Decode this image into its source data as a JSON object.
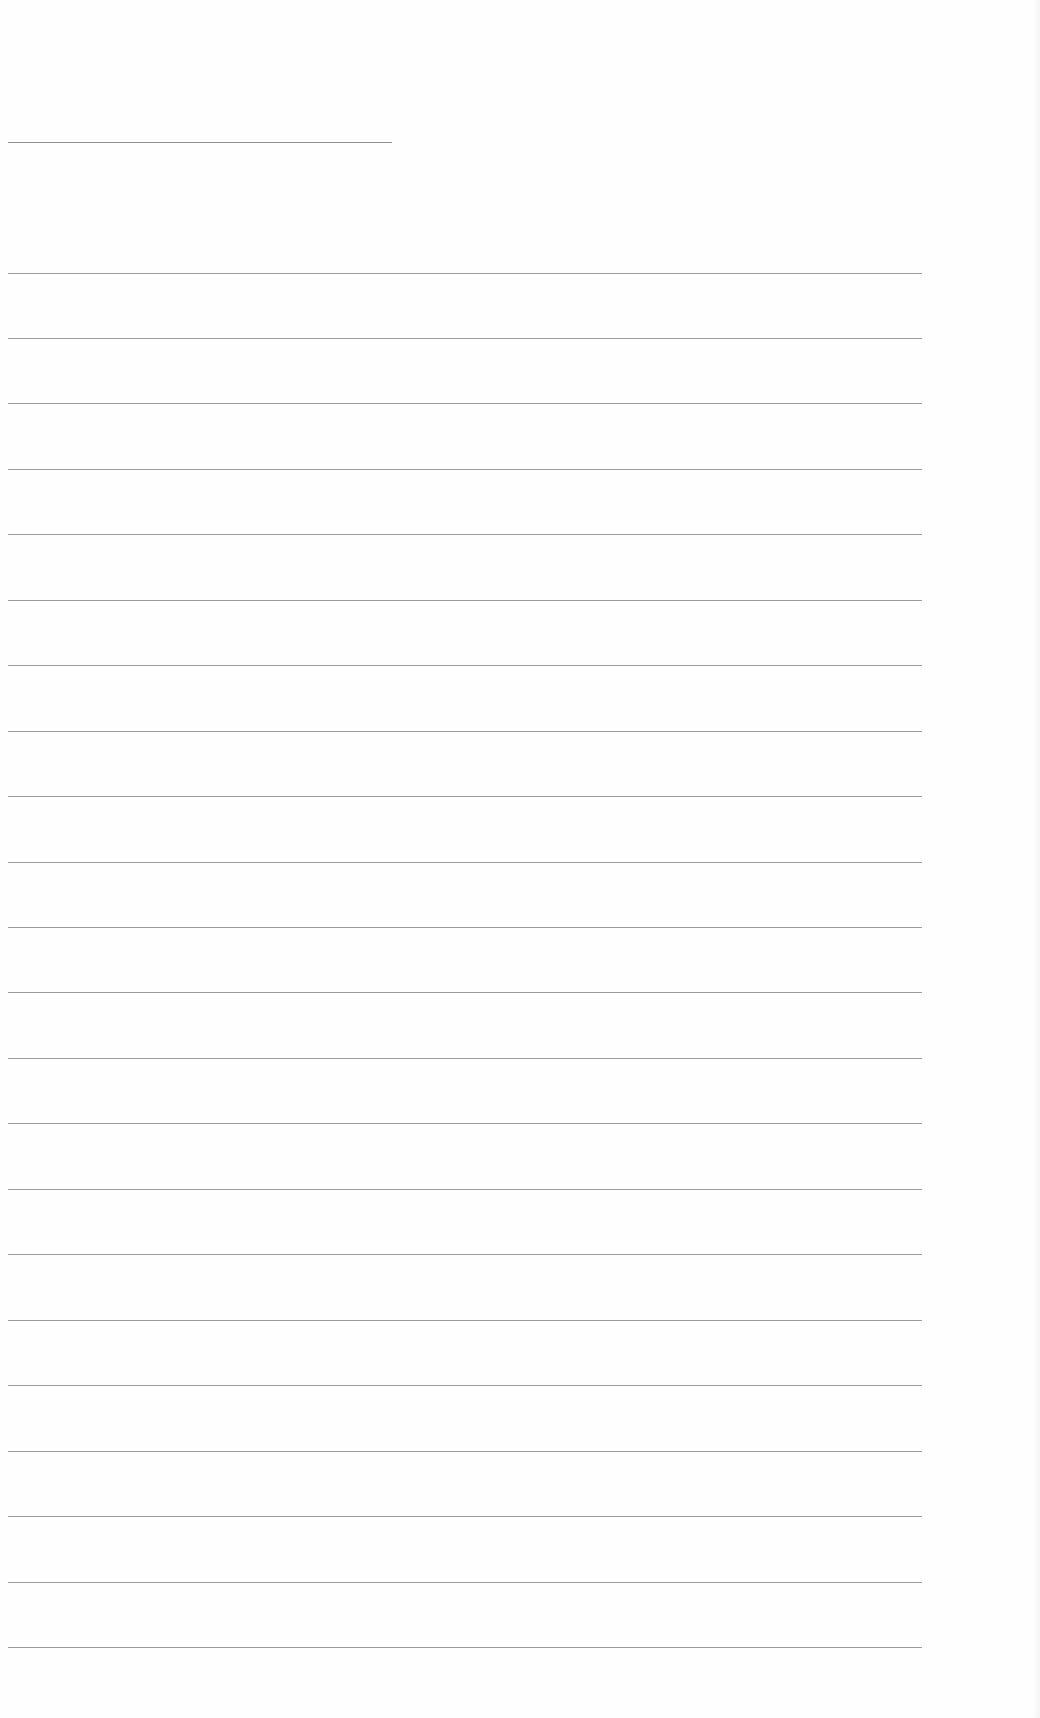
{
  "document": {
    "type": "blank-lined-page",
    "background": "#fefefe",
    "rule_color": "#8a8a8a",
    "header_rule": {
      "x1": 8,
      "x2": 392,
      "y": 142
    },
    "body_rules": {
      "x1": 8,
      "x2": 922,
      "count": 22,
      "y_positions": [
        273,
        338,
        403,
        469,
        534,
        600,
        665,
        731,
        796,
        862,
        927,
        992,
        1058,
        1123,
        1189,
        1254,
        1320,
        1385,
        1451,
        1516,
        1582,
        1647
      ]
    }
  }
}
